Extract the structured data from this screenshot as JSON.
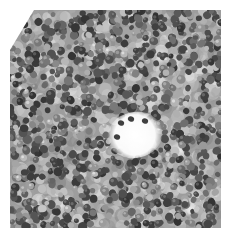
{
  "image": {
    "kind": "grayscale histology micrograph",
    "region": {
      "x": 10,
      "y": 10,
      "width": 211,
      "height": 218
    },
    "background": "#ffffff",
    "corner_cut": {
      "corner": "top-left",
      "size": 18
    },
    "palette": {
      "dark": "#161616",
      "mid": "#7a7a7a",
      "light": "#e6e6e6",
      "white": "#ffffff"
    },
    "cells": {
      "count": 1150,
      "min_radius": 2.4,
      "max_radius": 4.6,
      "seed": 7
    },
    "pale_patches": [
      {
        "x": 58,
        "y": 70,
        "r": 14
      },
      {
        "x": 160,
        "y": 58,
        "r": 10
      },
      {
        "x": 35,
        "y": 150,
        "r": 9
      },
      {
        "x": 180,
        "y": 150,
        "r": 10
      },
      {
        "x": 100,
        "y": 40,
        "r": 8
      },
      {
        "x": 60,
        "y": 205,
        "r": 9
      },
      {
        "x": 190,
        "y": 210,
        "r": 8
      }
    ],
    "lumen": {
      "x": 135,
      "y": 135,
      "rx": 22,
      "ry": 17
    }
  }
}
